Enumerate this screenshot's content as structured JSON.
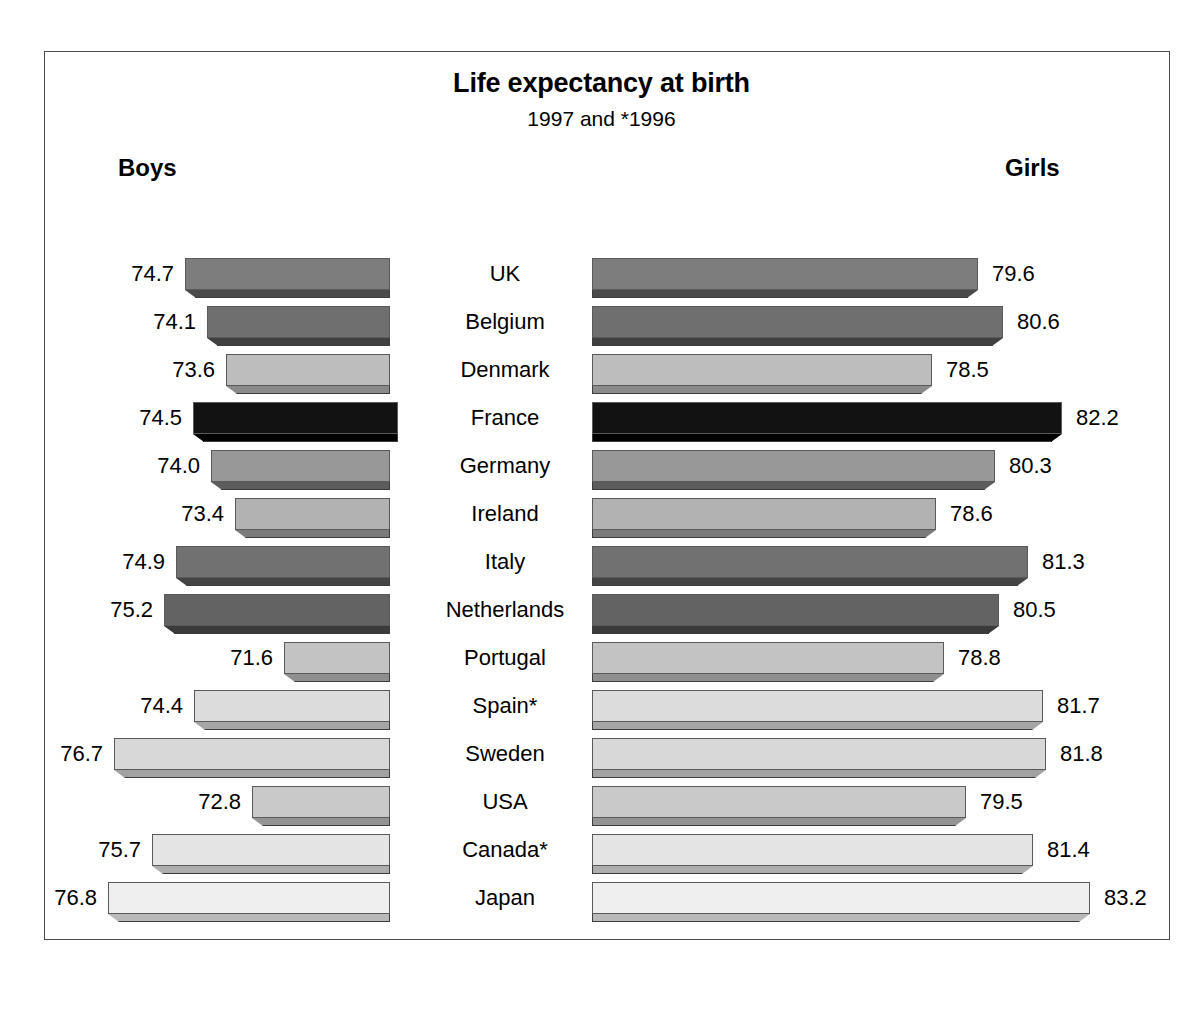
{
  "chart_data": {
    "type": "bar",
    "orientation": "horizontal",
    "subtype": "bidirectional-3d-bar",
    "title": "Life expectancy at birth",
    "subtitle": "1997 and *1996",
    "left_header": "Boys",
    "right_header": "Girls",
    "xlabel": "",
    "ylabel": "",
    "grid": false,
    "legend": "none",
    "axis_note": "Bars are not drawn from a zero baseline; lengths encode years above an implied offset.",
    "categories": [
      "UK",
      "Belgium",
      "Denmark",
      "France",
      "Germany",
      "Ireland",
      "Italy",
      "Netherlands",
      "Portugal",
      "Spain*",
      "Sweden",
      "USA",
      "Canada*",
      "Japan"
    ],
    "series": [
      {
        "name": "Boys",
        "values": [
          74.7,
          74.1,
          73.6,
          74.5,
          74.0,
          73.4,
          74.9,
          75.2,
          71.6,
          74.4,
          76.7,
          72.8,
          75.7,
          76.8
        ]
      },
      {
        "name": "Girls",
        "values": [
          79.6,
          80.6,
          78.5,
          82.2,
          80.3,
          78.6,
          81.3,
          80.5,
          78.8,
          81.7,
          81.8,
          79.5,
          81.4,
          83.2
        ]
      }
    ],
    "annotations": [
      "* denotes 1996 data (Spain*, Canada*)"
    ]
  },
  "rows": [
    {
      "country": "UK",
      "boys": "74.7",
      "girls": "79.6",
      "boys_label": "74.7",
      "girls_label": "79.6",
      "face": "#7d7d7d",
      "shadow": "#4a4a4a",
      "left_start": 185,
      "left_end": 390,
      "right_start": 592,
      "right_end": 978
    },
    {
      "country": "Belgium",
      "boys": "74.1",
      "girls": "80.6",
      "boys_label": "74.1",
      "girls_label": "80.6",
      "face": "#6f6f6f",
      "shadow": "#404040",
      "left_start": 207,
      "left_end": 390,
      "right_start": 592,
      "right_end": 1003
    },
    {
      "country": "Denmark",
      "boys": "73.6",
      "girls": "78.5",
      "boys_label": "73.6",
      "girls_label": "78.5",
      "face": "#bdbdbd",
      "shadow": "#8a8a8a",
      "left_start": 226,
      "left_end": 390,
      "right_start": 592,
      "right_end": 932
    },
    {
      "country": "France",
      "boys": "74.5",
      "girls": "82.2",
      "boys_label": "74.5",
      "girls_label": "82.2",
      "face": "#121212",
      "shadow": "#000000",
      "left_start": 193,
      "left_end": 398,
      "right_start": 592,
      "right_end": 1062
    },
    {
      "country": "Germany",
      "boys": "74.0",
      "girls": "80.3",
      "boys_label": "74.0",
      "girls_label": "80.3",
      "face": "#989898",
      "shadow": "#5c5c5c",
      "left_start": 211,
      "left_end": 390,
      "right_start": 592,
      "right_end": 995
    },
    {
      "country": "Ireland",
      "boys": "73.4",
      "girls": "78.6",
      "boys_label": "73.4",
      "girls_label": "78.6",
      "face": "#b2b2b2",
      "shadow": "#7b7b7b",
      "left_start": 235,
      "left_end": 390,
      "right_start": 592,
      "right_end": 936
    },
    {
      "country": "Italy",
      "boys": "74.9",
      "girls": "81.3",
      "boys_label": "74.9",
      "girls_label": "81.3",
      "face": "#717171",
      "shadow": "#444444",
      "left_start": 176,
      "left_end": 390,
      "right_start": 592,
      "right_end": 1028
    },
    {
      "country": "Netherlands",
      "boys": "75.2",
      "girls": "80.5",
      "boys_label": "75.2",
      "girls_label": "80.5",
      "face": "#636363",
      "shadow": "#3a3a3a",
      "left_start": 164,
      "left_end": 390,
      "right_start": 592,
      "right_end": 999
    },
    {
      "country": "Portugal",
      "boys": "71.6",
      "girls": "78.8",
      "boys_label": "71.6",
      "girls_label": "78.8",
      "face": "#c3c3c3",
      "shadow": "#8f8f8f",
      "left_start": 284,
      "left_end": 390,
      "right_start": 592,
      "right_end": 944
    },
    {
      "country": "Spain*",
      "boys": "74.4",
      "girls": "81.7",
      "boys_label": "74.4",
      "girls_label": "81.7",
      "face": "#dcdcdc",
      "shadow": "#a6a6a6",
      "left_start": 194,
      "left_end": 390,
      "right_start": 592,
      "right_end": 1043
    },
    {
      "country": "Sweden",
      "boys": "76.7",
      "girls": "81.8",
      "boys_label": "76.7",
      "girls_label": "81.8",
      "face": "#d8d8d8",
      "shadow": "#a2a2a2",
      "left_start": 114,
      "left_end": 390,
      "right_start": 592,
      "right_end": 1046
    },
    {
      "country": "USA",
      "boys": "72.8",
      "girls": "79.5",
      "boys_label": "72.8",
      "girls_label": "79.5",
      "face": "#c9c9c9",
      "shadow": "#949494",
      "left_start": 252,
      "left_end": 390,
      "right_start": 592,
      "right_end": 966
    },
    {
      "country": "Canada*",
      "boys": "75.7",
      "girls": "81.4",
      "boys_label": "75.7",
      "girls_label": "81.4",
      "face": "#e4e4e4",
      "shadow": "#adadad",
      "left_start": 152,
      "left_end": 390,
      "right_start": 592,
      "right_end": 1033
    },
    {
      "country": "Japan",
      "boys": "76.8",
      "girls": "83.2",
      "boys_label": "76.8",
      "girls_label": "83.2",
      "face": "#efefef",
      "shadow": "#b9b9b9",
      "left_start": 108,
      "left_end": 390,
      "right_start": 592,
      "right_end": 1090
    }
  ]
}
